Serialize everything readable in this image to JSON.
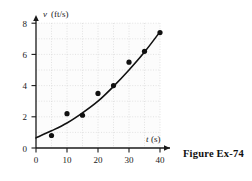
{
  "figure": {
    "caption": "Figure Ex-74"
  },
  "chart_data": {
    "type": "scatter",
    "title": "",
    "xlabel": "t",
    "xunit": "(s)",
    "ylabel": "v",
    "yunit": "(ft/s)",
    "xlim": [
      0,
      40
    ],
    "ylim": [
      0,
      8
    ],
    "xticks": [
      0,
      10,
      20,
      30,
      40
    ],
    "yticks": [
      0,
      2,
      4,
      6,
      8
    ],
    "xtick_labels": [
      "0",
      "10",
      "20",
      "30",
      "40"
    ],
    "ytick_labels": [
      "0",
      "2",
      "4",
      "6",
      "8"
    ],
    "grid": true,
    "grid_minor_step_x": 5,
    "grid_minor_step_y": 1,
    "legend": "none",
    "x": [
      5,
      10,
      15,
      20,
      25,
      30,
      35,
      40
    ],
    "values": [
      0.8,
      2.2,
      2.1,
      3.5,
      4.0,
      5.5,
      6.2,
      7.4
    ],
    "series": [
      {
        "name": "measured velocity",
        "marker": "filled-circle",
        "x": [
          5,
          10,
          15,
          20,
          25,
          30,
          35,
          40
        ],
        "values": [
          0.8,
          2.2,
          2.1,
          3.5,
          4.0,
          5.5,
          6.2,
          7.4
        ]
      },
      {
        "name": "fitted curve",
        "marker": "none",
        "line": "solid",
        "x": [
          0,
          5,
          10,
          15,
          20,
          25,
          30,
          35,
          40
        ],
        "values": [
          0.65,
          1.1,
          1.6,
          2.25,
          3.0,
          3.95,
          5.0,
          6.15,
          7.45
        ]
      }
    ],
    "colors": {
      "axis": "#1a1a1a",
      "marker": "#111111",
      "curve": "#111111",
      "grid": "#c9c9c9",
      "plot_background": "#fcfcfc"
    }
  }
}
